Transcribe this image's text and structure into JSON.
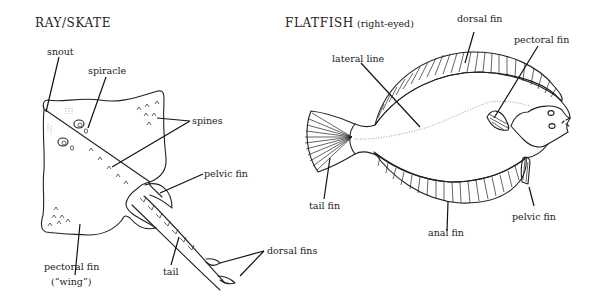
{
  "ray": {
    "title": "RAY/SKATE",
    "labels": {
      "snout": "snout",
      "spiracle": "spiracle",
      "spines": "spines",
      "pelvic_fin": "pelvic fin",
      "pectoral_fin": "pectoral fin",
      "wing": "(“wing”)",
      "tail": "tail",
      "dorsal_fins": "dorsal fins"
    }
  },
  "flatfish": {
    "title": "FLATFISH",
    "subtitle": "(right-eyed)",
    "labels": {
      "dorsal_fin": "dorsal fin",
      "pectoral_fin": "pectoral fin",
      "lateral_line": "lateral line",
      "tail_fin": "tail fin",
      "anal_fin": "anal fin",
      "pelvic_fin": "pelvic fin"
    }
  },
  "colors": {
    "ink": "#222222",
    "background": "#ffffff",
    "lateral_line": "#888888"
  }
}
